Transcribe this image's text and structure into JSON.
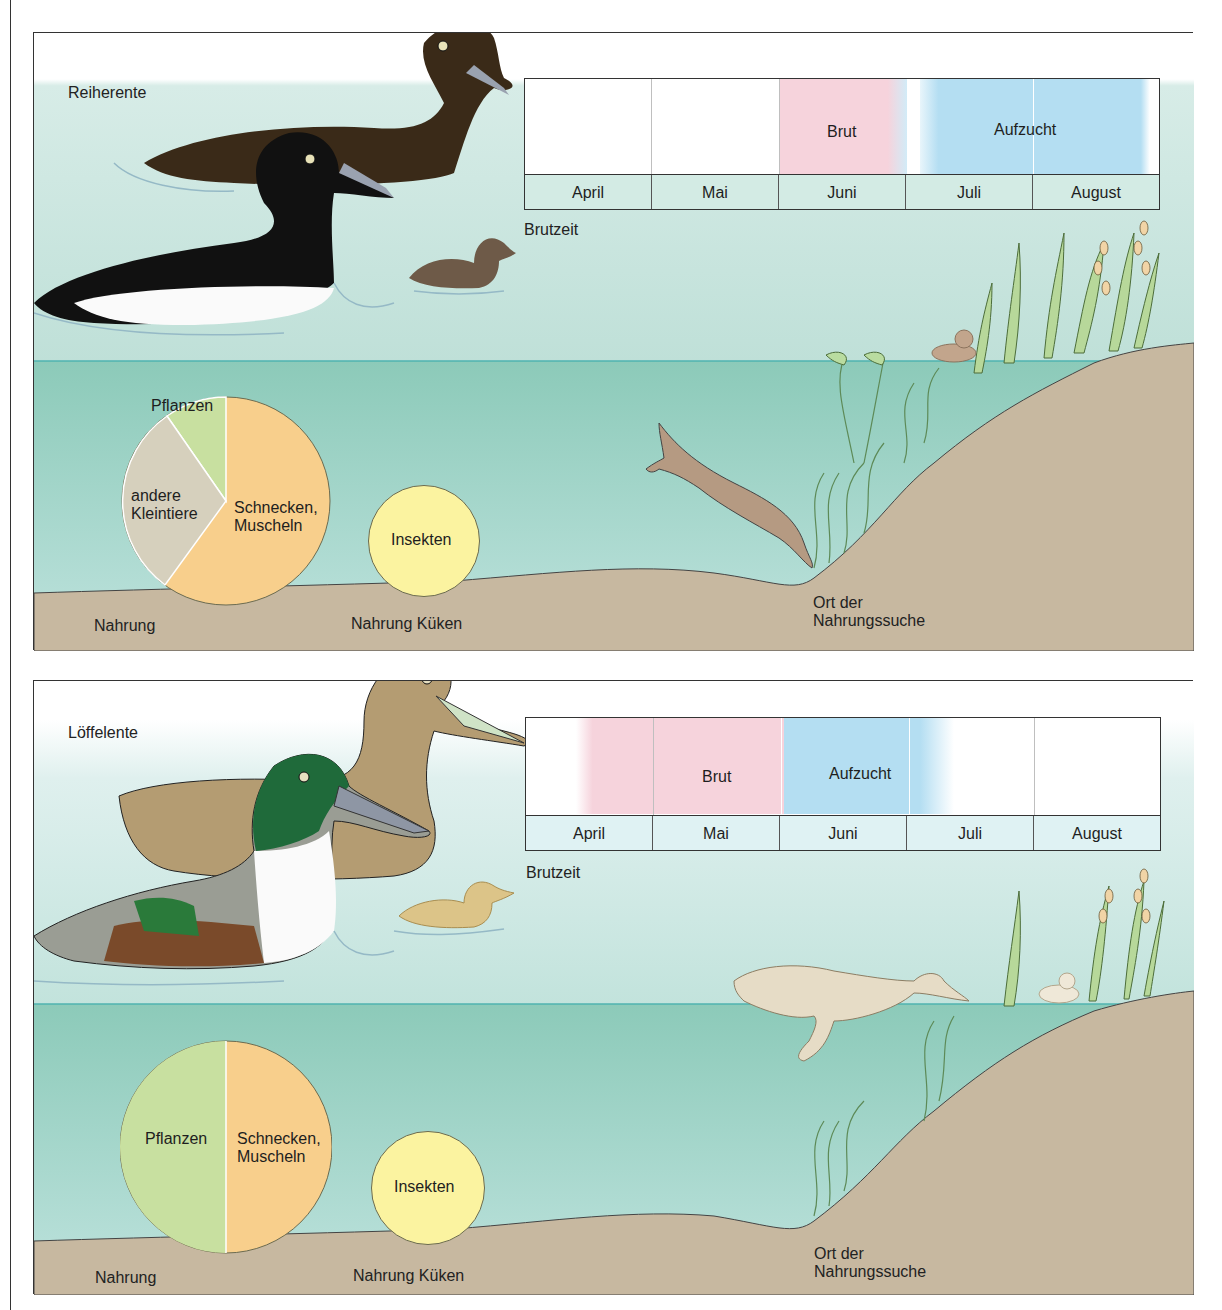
{
  "panels": [
    {
      "species": "Reiherente",
      "timeline": {
        "caption": "Brutzeit",
        "months": [
          "April",
          "Mai",
          "Juni",
          "Juli",
          "August"
        ],
        "phases": [
          {
            "label": "Brut",
            "start_month": 2.0,
            "end_month": 3.0,
            "color": "#f6d3dc"
          },
          {
            "label": "Aufzucht",
            "start_month": 3.1,
            "end_month": 5.0,
            "color": "#b4def2"
          }
        ]
      },
      "diet_adult": {
        "caption": "Nahrung",
        "slices": [
          {
            "label": "Schnecken, Muscheln",
            "line1": "Schnecken,",
            "line2": "Muscheln",
            "share": 60,
            "color": "#f8cf8c"
          },
          {
            "label": "andere Kleintiere",
            "line1": "andere",
            "line2": "Kleintiere",
            "share": 30,
            "color": "#d6d0bd"
          },
          {
            "label": "Pflanzen",
            "line1": "Pflanzen",
            "line2": "",
            "share": 10,
            "color": "#c8e0a0"
          }
        ]
      },
      "diet_chick": {
        "caption": "Nahrung Küken",
        "label": "Insekten",
        "color": "#fbf3a0"
      },
      "feeding_place": {
        "line1": "Ort der",
        "line2": "Nahrungssuche"
      }
    },
    {
      "species": "Löffelente",
      "timeline": {
        "caption": "Brutzeit",
        "months": [
          "April",
          "Mai",
          "Juni",
          "Juli",
          "August"
        ],
        "phases": [
          {
            "label": "Brut",
            "start_month": 0.5,
            "end_month": 2.0,
            "color": "#f6d3dc"
          },
          {
            "label": "Aufzucht",
            "start_month": 2.0,
            "end_month": 3.3,
            "color": "#b4def2"
          }
        ]
      },
      "diet_adult": {
        "caption": "Nahrung",
        "slices": [
          {
            "label": "Pflanzen",
            "line1": "Pflanzen",
            "line2": "",
            "share": 50,
            "color": "#c8e0a0"
          },
          {
            "label": "Schnecken, Muscheln",
            "line1": "Schnecken,",
            "line2": "Muscheln",
            "share": 50,
            "color": "#f8cf8c"
          }
        ]
      },
      "diet_chick": {
        "caption": "Nahrung Küken",
        "label": "Insekten",
        "color": "#fbf3a0"
      },
      "feeding_place": {
        "line1": "Ort der",
        "line2": "Nahrungssuche"
      }
    }
  ],
  "colors": {
    "sky": "#e4f2ee",
    "water_surface": "#cbe6df",
    "water_deep": "#86c7b8",
    "water_line": "#4fb3b0",
    "ground": "#c8bba3",
    "shore": "#c5ae92",
    "border": "#333333"
  }
}
